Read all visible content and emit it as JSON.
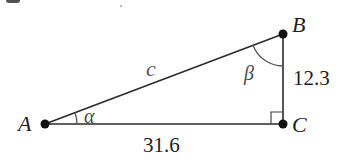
{
  "figure": {
    "type": "right-triangle",
    "vertices": {
      "A": {
        "label": "A",
        "x": 45,
        "y": 124
      },
      "B": {
        "label": "B",
        "x": 283,
        "y": 34
      },
      "C": {
        "label": "C",
        "x": 283,
        "y": 124
      }
    },
    "sides": {
      "hypotenuse": {
        "label": "c",
        "from": "A",
        "to": "B"
      },
      "vertical": {
        "label": "12.3",
        "from": "B",
        "to": "C"
      },
      "horizontal": {
        "label": "31.6",
        "from": "A",
        "to": "C"
      }
    },
    "angles": {
      "at_A": {
        "label": "α"
      },
      "at_B": {
        "label": "β"
      },
      "at_C": {
        "label": "right-angle"
      }
    },
    "colors": {
      "stroke": "#2a2a2a",
      "vertex_dot": "#111111",
      "text": "#1e1e1e",
      "arc": "#555555"
    }
  }
}
